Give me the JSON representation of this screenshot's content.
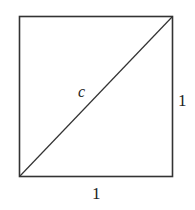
{
  "diagram": {
    "type": "unit-square-with-diagonal",
    "labels": {
      "diagonal": "c",
      "right_side": "1",
      "bottom_side": "1"
    },
    "colors": {
      "stroke": "#333333",
      "background": "#ffffff"
    }
  }
}
